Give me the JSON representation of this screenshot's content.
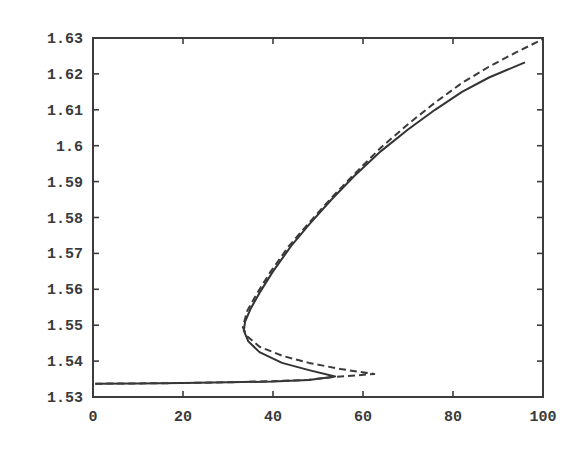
{
  "chart_data": {
    "type": "line",
    "title": "",
    "xlabel": "",
    "ylabel": "",
    "xlim": [
      0,
      100
    ],
    "ylim": [
      1.53,
      1.63
    ],
    "grid": false,
    "legend": null,
    "x_ticks": [
      0,
      20,
      40,
      60,
      80,
      100
    ],
    "x_tick_labels": [
      "0",
      "20",
      "40",
      "60",
      "80",
      "100"
    ],
    "y_ticks": [
      1.53,
      1.54,
      1.55,
      1.56,
      1.57,
      1.58,
      1.59,
      1.6,
      1.61,
      1.62,
      1.63
    ],
    "y_tick_labels": [
      "1.53",
      "1.54",
      "1.55",
      "1.56",
      "1.57",
      "1.58",
      "1.59",
      "1.6",
      "1.61",
      "1.62",
      "1.63"
    ],
    "series": [
      {
        "name": "solid",
        "style": "solid",
        "color": "#333333",
        "points": [
          [
            0.5,
            1.5337
          ],
          [
            10,
            1.5338
          ],
          [
            20,
            1.5339
          ],
          [
            30,
            1.5341
          ],
          [
            40,
            1.5343
          ],
          [
            48,
            1.5347
          ],
          [
            53.8,
            1.5357
          ],
          [
            48,
            1.5375
          ],
          [
            42,
            1.5395
          ],
          [
            37,
            1.5425
          ],
          [
            34.5,
            1.5455
          ],
          [
            33.5,
            1.5485
          ],
          [
            33.8,
            1.551
          ],
          [
            35,
            1.5545
          ],
          [
            37,
            1.559
          ],
          [
            40,
            1.565
          ],
          [
            44,
            1.572
          ],
          [
            48,
            1.578
          ],
          [
            53,
            1.585
          ],
          [
            58,
            1.5915
          ],
          [
            64,
            1.5985
          ],
          [
            70,
            1.6045
          ],
          [
            76,
            1.61
          ],
          [
            82,
            1.615
          ],
          [
            88,
            1.619
          ],
          [
            96,
            1.6232
          ]
        ]
      },
      {
        "name": "dashed",
        "style": "dashed",
        "color": "#3a3a3a",
        "points": [
          [
            0.5,
            1.5337
          ],
          [
            10,
            1.5338
          ],
          [
            20,
            1.5339
          ],
          [
            30,
            1.5341
          ],
          [
            40,
            1.5344
          ],
          [
            48,
            1.5348
          ],
          [
            53.8,
            1.5356
          ],
          [
            62.5,
            1.5364
          ],
          [
            55,
            1.5378
          ],
          [
            48,
            1.5395
          ],
          [
            42,
            1.5415
          ],
          [
            37,
            1.544
          ],
          [
            34.2,
            1.547
          ],
          [
            33.3,
            1.5495
          ],
          [
            34.3,
            1.554
          ],
          [
            36.5,
            1.559
          ],
          [
            39.5,
            1.565
          ],
          [
            43.5,
            1.572
          ],
          [
            48,
            1.5785
          ],
          [
            53,
            1.5855
          ],
          [
            58,
            1.592
          ],
          [
            64,
            1.5995
          ],
          [
            70,
            1.606
          ],
          [
            76,
            1.612
          ],
          [
            82,
            1.6175
          ],
          [
            88,
            1.622
          ],
          [
            94,
            1.626
          ],
          [
            100,
            1.6297
          ]
        ]
      }
    ]
  }
}
